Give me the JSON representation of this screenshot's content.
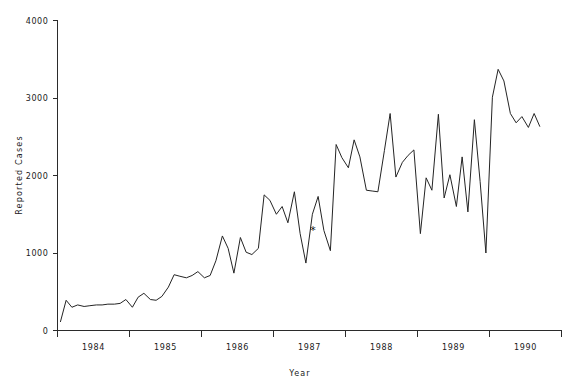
{
  "chart_data": {
    "type": "line",
    "title": "",
    "xlabel": "Year",
    "ylabel": "Reported Cases",
    "ylim": [
      0,
      4000
    ],
    "xlim": [
      1983.5,
      1990.5
    ],
    "grid": false,
    "legend": null,
    "y_ticks": [
      0,
      1000,
      2000,
      3000,
      4000
    ],
    "y_tick_labels": [
      "0",
      "1000",
      "2000",
      "3000",
      "4000"
    ],
    "x_ticks": [
      1983.5,
      1984.5,
      1985.5,
      1986.5,
      1987.5,
      1988.5,
      1989.5,
      1990.5
    ],
    "x_tick_labels": [
      "1984",
      "1985",
      "1986",
      "1987",
      "1988",
      "1989",
      "1990"
    ],
    "annotations": [
      {
        "symbol": "*",
        "x": 1987.05,
        "y": 1290,
        "name": "asterisk-marker"
      }
    ],
    "series": [
      {
        "name": "Reported Cases",
        "color": "#242424",
        "x": [
          1983.54,
          1983.62,
          1983.7,
          1983.78,
          1983.87,
          1983.95,
          1984.04,
          1984.12,
          1984.2,
          1984.29,
          1984.37,
          1984.45,
          1984.54,
          1984.62,
          1984.7,
          1984.79,
          1984.87,
          1984.95,
          1985.04,
          1985.12,
          1985.2,
          1985.29,
          1985.37,
          1985.45,
          1985.54,
          1985.62,
          1985.7,
          1985.79,
          1985.87,
          1985.95,
          1986.04,
          1986.12,
          1986.2,
          1986.29,
          1986.37,
          1986.45,
          1986.54,
          1986.62,
          1986.7,
          1986.79,
          1986.87,
          1986.95,
          1987.04,
          1987.12,
          1987.2,
          1987.29,
          1987.37,
          1987.45,
          1987.54,
          1987.62,
          1987.7,
          1987.79,
          1987.87,
          1987.95,
          1988.04,
          1988.12,
          1988.2,
          1988.29,
          1988.37,
          1988.45,
          1988.54,
          1988.62,
          1988.7,
          1988.79,
          1988.87,
          1988.95,
          1989.04,
          1989.12,
          1989.2,
          1989.29,
          1989.37,
          1989.45,
          1989.54,
          1989.62,
          1989.7,
          1989.79,
          1989.87,
          1989.95,
          1990.04,
          1990.12,
          1990.2
        ],
        "values": [
          110,
          390,
          300,
          330,
          310,
          320,
          330,
          330,
          340,
          340,
          350,
          400,
          300,
          430,
          480,
          400,
          390,
          440,
          560,
          720,
          700,
          680,
          710,
          760,
          680,
          710,
          900,
          1220,
          1060,
          740,
          1200,
          1010,
          980,
          1060,
          1750,
          1680,
          1500,
          1600,
          1390,
          1790,
          1250,
          870,
          1500,
          1730,
          1290,
          1030,
          2400,
          2230,
          2100,
          2460,
          2240,
          1810,
          1800,
          1790,
          2320,
          2800,
          1980,
          2170,
          2260,
          2330,
          1250,
          1970,
          1810,
          2790,
          1710,
          2010,
          1600,
          2240,
          1530,
          2720,
          1920,
          1000,
          3010,
          3370,
          3220,
          2800,
          2680,
          2760,
          2620,
          2800,
          2630
        ]
      }
    ]
  },
  "axis": {
    "y_label": "Reported Cases",
    "x_label": "Year"
  }
}
